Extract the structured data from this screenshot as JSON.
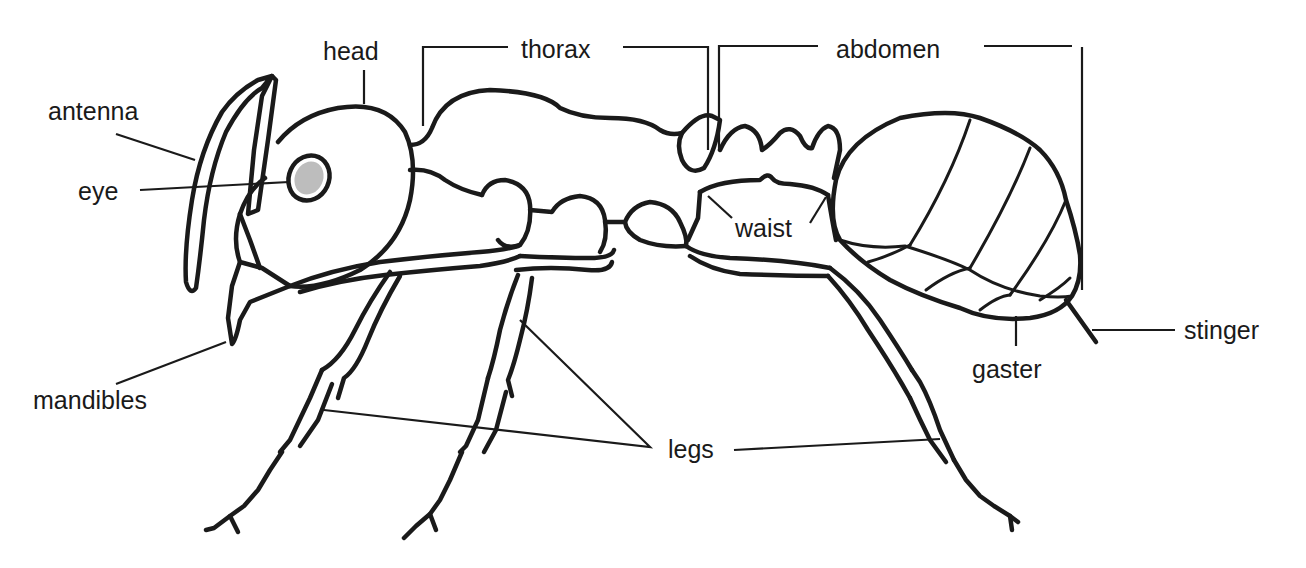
{
  "diagram": {
    "colors": {
      "ink": "#1a1a1a",
      "background": "#ffffff"
    },
    "labels": {
      "head": "head",
      "thorax": "thorax",
      "abdomen": "abdomen",
      "antenna": "antenna",
      "eye": "eye",
      "waist": "waist",
      "mandibles": "mandibles",
      "legs": "legs",
      "gaster": "gaster",
      "stinger": "stinger"
    }
  }
}
